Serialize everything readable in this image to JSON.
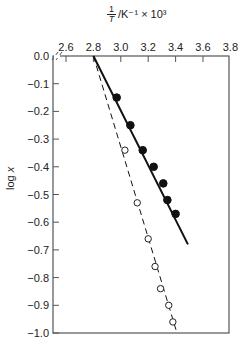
{
  "chart_data": {
    "type": "line",
    "title": "",
    "xlabel": "1/T /K⁻¹ × 10³",
    "xlabel_parts": {
      "numerator": "1",
      "denominator": "T",
      "rest": "/K⁻¹ × 10³"
    },
    "ylabel": "log x",
    "ylabel_parts": {
      "prefix": "log ",
      "var": "x"
    },
    "x_axis_position": "top",
    "x_ticks": [
      "2.6",
      "2.8",
      "3.0",
      "3.2",
      "3.4",
      "3.6",
      "3.8"
    ],
    "y_ticks": [
      "0.0",
      "−0.1",
      "−0.2",
      "−0.3",
      "−0.4",
      "−0.5",
      "−0.6",
      "−0.7",
      "−0.8",
      "−0.9",
      "−1.0"
    ],
    "xlim": [
      2.51,
      3.8
    ],
    "ylim": [
      -1.0,
      0.0
    ],
    "axis_break": "x-axis near origin (//)",
    "grid": false,
    "legend": null,
    "series": [
      {
        "name": "filled circles (solid line)",
        "marker": "filled-circle",
        "line_style": "solid",
        "points": [
          {
            "x": 2.97,
            "y": -0.15
          },
          {
            "x": 3.07,
            "y": -0.25
          },
          {
            "x": 3.16,
            "y": -0.34
          },
          {
            "x": 3.24,
            "y": -0.4
          },
          {
            "x": 3.31,
            "y": -0.46
          },
          {
            "x": 3.34,
            "y": -0.52
          },
          {
            "x": 3.4,
            "y": -0.57
          }
        ],
        "fit_line": [
          {
            "x": 2.8,
            "y": 0.0
          },
          {
            "x": 3.49,
            "y": -0.68
          }
        ]
      },
      {
        "name": "open circles (dashed line)",
        "marker": "open-circle",
        "line_style": "dashed",
        "points": [
          {
            "x": 3.03,
            "y": -0.34
          },
          {
            "x": 3.12,
            "y": -0.53
          },
          {
            "x": 3.2,
            "y": -0.66
          },
          {
            "x": 3.25,
            "y": -0.76
          },
          {
            "x": 3.29,
            "y": -0.84
          },
          {
            "x": 3.35,
            "y": -0.9
          },
          {
            "x": 3.38,
            "y": -0.96
          }
        ],
        "fit_line": [
          {
            "x": 2.8,
            "y": 0.0
          },
          {
            "x": 3.41,
            "y": -1.0
          }
        ]
      }
    ]
  }
}
